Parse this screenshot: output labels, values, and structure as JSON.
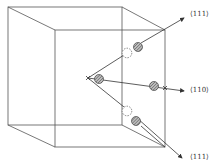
{
  "diagram": {
    "type": "crystal-cube-directions",
    "colors": {
      "line": "#444444",
      "atom_fill": "#8a8a8a",
      "vacancy_stroke": "#555555"
    },
    "labels": [
      {
        "id": "dir-upper",
        "text": "⟨111⟩"
      },
      {
        "id": "dir-middle",
        "text": "⟨110⟩"
      },
      {
        "id": "dir-lower",
        "text": "⟨111⟩"
      }
    ]
  }
}
